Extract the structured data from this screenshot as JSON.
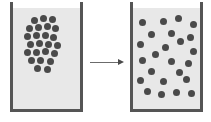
{
  "figure": {
    "width": 211,
    "height": 122,
    "background": "#ffffff",
    "caption": "",
    "description": "Two beakers side by side connected by a rightward arrow, showing particles initially clustered in one corner and later dispersed evenly."
  },
  "colors": {
    "beaker_wall": "#555555",
    "beaker_fill": "#e8e8e8",
    "particle": "#4a4a4a",
    "arrow_shaft": "#6b6b6b",
    "arrow_head": "#4a4a4a",
    "page_background": "#ffffff"
  },
  "arrow": {
    "label": "",
    "icon": "arrow-right-icon",
    "direction": "right",
    "x": 90,
    "y": 62,
    "length": 34
  },
  "left_beaker": {
    "label": "",
    "x": 10,
    "y": 2,
    "width": 73,
    "height": 110,
    "particle_count": 24,
    "state": "clustered",
    "particles": [
      {
        "x": 21,
        "y": 15
      },
      {
        "x": 30,
        "y": 13
      },
      {
        "x": 39,
        "y": 14
      },
      {
        "x": 16,
        "y": 23
      },
      {
        "x": 25,
        "y": 22
      },
      {
        "x": 34,
        "y": 21
      },
      {
        "x": 42,
        "y": 23
      },
      {
        "x": 14,
        "y": 31
      },
      {
        "x": 23,
        "y": 30
      },
      {
        "x": 32,
        "y": 30
      },
      {
        "x": 40,
        "y": 32
      },
      {
        "x": 17,
        "y": 39
      },
      {
        "x": 26,
        "y": 38
      },
      {
        "x": 35,
        "y": 39
      },
      {
        "x": 44,
        "y": 40
      },
      {
        "x": 14,
        "y": 47
      },
      {
        "x": 23,
        "y": 47
      },
      {
        "x": 32,
        "y": 46
      },
      {
        "x": 41,
        "y": 48
      },
      {
        "x": 18,
        "y": 55
      },
      {
        "x": 27,
        "y": 55
      },
      {
        "x": 37,
        "y": 56
      },
      {
        "x": 24,
        "y": 63
      },
      {
        "x": 34,
        "y": 64
      }
    ]
  },
  "right_beaker": {
    "label": "",
    "x": 130,
    "y": 2,
    "width": 73,
    "height": 110,
    "particle_count": 24,
    "state": "dispersed",
    "particles": [
      {
        "x": 9,
        "y": 17
      },
      {
        "x": 30,
        "y": 16
      },
      {
        "x": 45,
        "y": 13
      },
      {
        "x": 60,
        "y": 19
      },
      {
        "x": 18,
        "y": 29
      },
      {
        "x": 38,
        "y": 28
      },
      {
        "x": 57,
        "y": 32
      },
      {
        "x": 7,
        "y": 39
      },
      {
        "x": 32,
        "y": 42
      },
      {
        "x": 47,
        "y": 36
      },
      {
        "x": 22,
        "y": 49
      },
      {
        "x": 60,
        "y": 46
      },
      {
        "x": 9,
        "y": 55
      },
      {
        "x": 38,
        "y": 56
      },
      {
        "x": 55,
        "y": 58
      },
      {
        "x": 18,
        "y": 66
      },
      {
        "x": 46,
        "y": 67
      },
      {
        "x": 7,
        "y": 75
      },
      {
        "x": 30,
        "y": 76
      },
      {
        "x": 53,
        "y": 74
      },
      {
        "x": 14,
        "y": 86
      },
      {
        "x": 28,
        "y": 89
      },
      {
        "x": 43,
        "y": 87
      },
      {
        "x": 58,
        "y": 88
      }
    ]
  }
}
